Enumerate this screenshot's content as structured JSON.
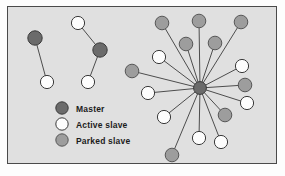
{
  "figure": {
    "background_color": "#e0e0e0",
    "page_color": "#fdfdfd",
    "border_color": "#4a4a4a",
    "link_color": "#4d4d4d"
  },
  "colors": {
    "master": "#6b6b6b",
    "master_stroke": "#3a3a3a",
    "active_slave": "#fdfdfd",
    "active_slave_stroke": "#3a3a3a",
    "parked_slave": "#9d9d9d",
    "parked_slave_stroke": "#575757"
  },
  "legend": {
    "items": [
      {
        "label": "Master",
        "type": "master",
        "swatch": "master-swatch-icon",
        "cx": 62,
        "cy": 108,
        "r": 6.2,
        "text_x": 76,
        "text_y": 105
      },
      {
        "label": "Active slave",
        "type": "active_slave",
        "swatch": "active-slave-swatch-icon",
        "cx": 62,
        "cy": 124,
        "r": 6.2,
        "text_x": 76,
        "text_y": 121
      },
      {
        "label": "Parked slave",
        "type": "parked_slave",
        "swatch": "parked-slave-swatch-icon",
        "cx": 62,
        "cy": 140,
        "r": 6.2,
        "text_x": 76,
        "text_y": 137
      }
    ]
  },
  "piconets": [
    {
      "name": "piconet-left-1",
      "master": {
        "id": "m1",
        "type": "master",
        "cx": 35,
        "cy": 38,
        "r": 7.2
      },
      "slaves": [
        {
          "id": "p1s1",
          "type": "active_slave",
          "cx": 47,
          "cy": 82,
          "r": 6.6
        }
      ],
      "links": [
        {
          "from": "m1",
          "to": "p1s1"
        }
      ]
    },
    {
      "name": "piconet-left-2",
      "master": {
        "id": "m2",
        "type": "master",
        "cx": 100,
        "cy": 50,
        "r": 7.2
      },
      "slaves": [
        {
          "id": "p2s1",
          "type": "active_slave",
          "cx": 78,
          "cy": 23,
          "r": 6.6
        },
        {
          "id": "p2s2",
          "type": "active_slave",
          "cx": 88,
          "cy": 82,
          "r": 6.6
        }
      ],
      "links": [
        {
          "from": "m2",
          "to": "p2s1"
        },
        {
          "from": "m2",
          "to": "p2s2"
        }
      ]
    },
    {
      "name": "piconet-star",
      "master": {
        "id": "m3",
        "type": "master",
        "cx": 200,
        "cy": 88,
        "r": 6.4
      },
      "slaves": [
        {
          "id": "s01",
          "type": "parked_slave",
          "cx": 162,
          "cy": 23,
          "r": 6.8
        },
        {
          "id": "s02",
          "type": "parked_slave",
          "cx": 199,
          "cy": 21,
          "r": 6.8
        },
        {
          "id": "s03",
          "type": "parked_slave",
          "cx": 241,
          "cy": 22,
          "r": 6.8
        },
        {
          "id": "s04",
          "type": "parked_slave",
          "cx": 186,
          "cy": 44,
          "r": 6.8
        },
        {
          "id": "s05",
          "type": "parked_slave",
          "cx": 215,
          "cy": 43,
          "r": 6.8
        },
        {
          "id": "s06",
          "type": "active_slave",
          "cx": 159,
          "cy": 57,
          "r": 6.6
        },
        {
          "id": "s07",
          "type": "parked_slave",
          "cx": 132,
          "cy": 71,
          "r": 6.8
        },
        {
          "id": "s08",
          "type": "active_slave",
          "cx": 148,
          "cy": 93,
          "r": 6.6
        },
        {
          "id": "s09",
          "type": "active_slave",
          "cx": 164,
          "cy": 117,
          "r": 6.6
        },
        {
          "id": "s10",
          "type": "parked_slave",
          "cx": 172,
          "cy": 155,
          "r": 6.8
        },
        {
          "id": "s11",
          "type": "active_slave",
          "cx": 199,
          "cy": 138,
          "r": 6.6
        },
        {
          "id": "s12",
          "type": "active_slave",
          "cx": 221,
          "cy": 142,
          "r": 6.6
        },
        {
          "id": "s13",
          "type": "parked_slave",
          "cx": 225,
          "cy": 115,
          "r": 6.8
        },
        {
          "id": "s14",
          "type": "active_slave",
          "cx": 247,
          "cy": 103,
          "r": 6.6
        },
        {
          "id": "s15",
          "type": "parked_slave",
          "cx": 245,
          "cy": 85,
          "r": 6.8
        },
        {
          "id": "s16",
          "type": "active_slave",
          "cx": 242,
          "cy": 66,
          "r": 6.6
        }
      ],
      "links": [
        {
          "from": "m3",
          "to": "s01"
        },
        {
          "from": "m3",
          "to": "s02"
        },
        {
          "from": "m3",
          "to": "s03"
        },
        {
          "from": "m3",
          "to": "s04"
        },
        {
          "from": "m3",
          "to": "s05"
        },
        {
          "from": "m3",
          "to": "s06"
        },
        {
          "from": "m3",
          "to": "s07"
        },
        {
          "from": "m3",
          "to": "s08"
        },
        {
          "from": "m3",
          "to": "s09"
        },
        {
          "from": "m3",
          "to": "s10"
        },
        {
          "from": "m3",
          "to": "s11"
        },
        {
          "from": "m3",
          "to": "s12"
        },
        {
          "from": "m3",
          "to": "s13"
        },
        {
          "from": "m3",
          "to": "s14"
        },
        {
          "from": "m3",
          "to": "s15"
        },
        {
          "from": "m3",
          "to": "s16"
        }
      ]
    }
  ]
}
